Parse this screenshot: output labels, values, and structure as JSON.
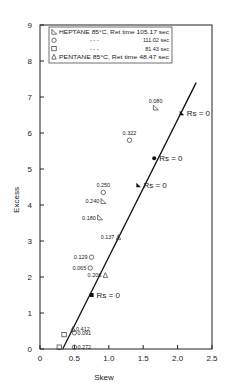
{
  "chart_data": {
    "type": "scatter",
    "title": "",
    "xlabel": "Skew",
    "ylabel": "Excess",
    "xlim": [
      0,
      2.5
    ],
    "ylim": [
      0,
      9
    ],
    "xticks": [
      "0",
      "0.5",
      "1.0",
      "1.5",
      "2.0",
      "2.5"
    ],
    "yticks": [
      "0",
      "1",
      "2",
      "3",
      "4",
      "5",
      "6",
      "7",
      "8",
      "9"
    ],
    "grid": false,
    "legend_position": "upper-left",
    "legend": [
      {
        "marker": "half-triangle",
        "text": "HEPTANE 85°C, Ret time 105.17 sec"
      },
      {
        "marker": "circle",
        "text": "111.02 sec"
      },
      {
        "marker": "square",
        "text": "81.43 sec"
      },
      {
        "marker": "triangle",
        "text": "PENTANE 85°C, Ret time 48.47 sec"
      }
    ],
    "legend_dashes": "-          -          -",
    "series": [
      {
        "name": "HEPTANE 85°C, 105.17 sec",
        "marker": "half-triangle",
        "points": [
          {
            "x": 1.68,
            "y": 6.7,
            "label": "0.080"
          },
          {
            "x": 0.92,
            "y": 4.1,
            "label": "0.240"
          },
          {
            "x": 0.87,
            "y": 3.65,
            "label": "0.180"
          },
          {
            "x": 2.06,
            "y": 6.55,
            "label": "Rs = 0"
          }
        ]
      },
      {
        "name": "111.02 sec",
        "marker": "circle",
        "points": [
          {
            "x": 1.3,
            "y": 5.8,
            "label": "0.322"
          },
          {
            "x": 0.92,
            "y": 4.35,
            "label": "0.250"
          },
          {
            "x": 0.75,
            "y": 2.55,
            "label": "0.129"
          },
          {
            "x": 0.73,
            "y": 2.25,
            "label": "0.065"
          },
          {
            "x": 0.5,
            "y": 0.45,
            "label": "0.091"
          },
          {
            "x": 0.5,
            "y": 0.05,
            "label": "0.272"
          },
          {
            "x": 1.66,
            "y": 5.3,
            "label": "Rs = 0"
          }
        ]
      },
      {
        "name": "81.43 sec",
        "marker": "square",
        "points": [
          {
            "x": 0.35,
            "y": 0.4,
            "label": ""
          },
          {
            "x": 0.28,
            "y": 0.05,
            "label": ""
          },
          {
            "x": 0.75,
            "y": 1.5,
            "label": "Rs = 0"
          }
        ]
      },
      {
        "name": "PENTANE 85°C, 48.47 sec",
        "marker": "triangle",
        "points": [
          {
            "x": 1.43,
            "y": 4.55,
            "label": "Rs = 0"
          },
          {
            "x": 1.14,
            "y": 3.1,
            "label": "0.137"
          },
          {
            "x": 0.95,
            "y": 2.05,
            "label": "0.206"
          },
          {
            "x": 0.48,
            "y": 0.55,
            "label": "0.412"
          }
        ]
      }
    ],
    "fit_line": {
      "x": [
        0.33,
        2.27
      ],
      "y": [
        0.0,
        7.4
      ]
    },
    "annotations": [
      "Rs = 0",
      "Rs = 0",
      "Rs = 0",
      "Rs = 0"
    ]
  }
}
